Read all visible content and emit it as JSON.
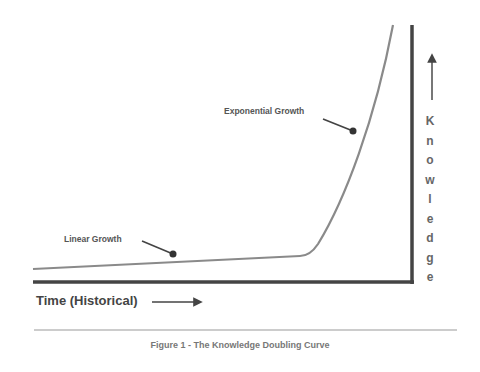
{
  "figure": {
    "caption": "Figure 1 - The Knowledge Doubling Curve",
    "x_axis_label": "Time (Historical)",
    "y_axis_label": "Knowledge",
    "y_axis_letters": [
      "K",
      "n",
      "o",
      "w",
      "l",
      "e",
      "d",
      "g",
      "e"
    ],
    "annotations": {
      "linear": "Linear Growth",
      "exponential": "Exponential Growth"
    },
    "colors": {
      "axis": "#444444",
      "curve": "#8a8a8a",
      "text": "#555555",
      "rule": "#999999"
    }
  }
}
